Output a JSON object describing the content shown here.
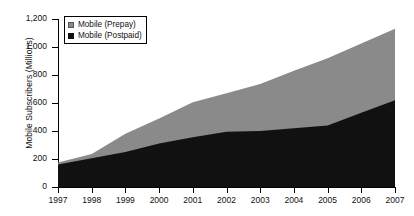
{
  "chart_data": {
    "type": "area",
    "stacked": true,
    "title": "",
    "xlabel": "",
    "ylabel": "Mobile Subscribers (Millions)",
    "categories": [
      "1997",
      "1998",
      "1999",
      "2000",
      "2001",
      "2002",
      "2003",
      "2004",
      "2005",
      "2006",
      "2007"
    ],
    "x": [
      1997,
      1998,
      1999,
      2000,
      2001,
      2002,
      2003,
      2004,
      2005,
      2006,
      2007
    ],
    "series": [
      {
        "name": "Mobile (Postpaid)",
        "color": "#111111",
        "values": [
          160,
          205,
          250,
          310,
          355,
          395,
          400,
          420,
          440,
          530,
          620
        ]
      },
      {
        "name": "Mobile (Prepay)",
        "color": "#8a8a8a",
        "values": [
          15,
          30,
          130,
          180,
          250,
          275,
          335,
          410,
          480,
          495,
          510
        ]
      }
    ],
    "totals": [
      175,
      235,
      380,
      490,
      605,
      670,
      735,
      830,
      920,
      1025,
      1130
    ],
    "ylim": [
      0,
      1200
    ],
    "yticks": [
      0,
      200,
      400,
      600,
      800,
      1000,
      1200
    ],
    "ytick_labels": [
      "0",
      "200",
      "400",
      "600",
      "800",
      "1,000",
      "1,200"
    ],
    "xlim": [
      1997,
      2007
    ],
    "grid": false,
    "legend_position": "top-left",
    "legend_entries": [
      {
        "label": "Mobile (Prepay)",
        "swatch": "gray"
      },
      {
        "label": "Mobile (Postpaid)",
        "swatch": "black"
      }
    ]
  },
  "colors": {
    "prepay": "#8a8a8a",
    "postpaid": "#111111",
    "axis": "#000000",
    "background": "#ffffff"
  }
}
